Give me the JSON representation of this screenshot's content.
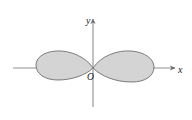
{
  "figure": {
    "kind": "math-plot",
    "title": "",
    "background_color": "#ffffff",
    "width": 192,
    "height": 120
  },
  "axes": {
    "x_axis": {
      "label": "x",
      "icon": "arrow-right-icon",
      "color": "#8a8a8a",
      "y_position": 68,
      "x_start": 13,
      "x_end": 176
    },
    "y_axis": {
      "label": "y",
      "icon": "arrow-up-icon",
      "color": "#8a8a8a",
      "x_position": 93,
      "y_top": 18,
      "y_bottom": 107
    },
    "origin": {
      "label": "O",
      "x": 93,
      "y": 68
    }
  },
  "curve": {
    "name": "lemniscate",
    "description": "two-lobed figure-eight curve crossing at the origin",
    "fill_color": "#d4d4d4",
    "stroke_color": "#6e6e6e",
    "stroke_width": 0.9,
    "left_lobe": {
      "x_min": 36,
      "x_max": 93,
      "y_top": 52,
      "y_bottom": 80
    },
    "right_lobe": {
      "x_min": 93,
      "x_max": 154,
      "y_top": 52,
      "y_bottom": 82
    }
  },
  "colors": {
    "background": "#ffffff",
    "axis": "#8a8a8a",
    "curve_fill": "#d4d4d4",
    "curve_stroke": "#6e6e6e",
    "text": "#1a1a1a"
  }
}
